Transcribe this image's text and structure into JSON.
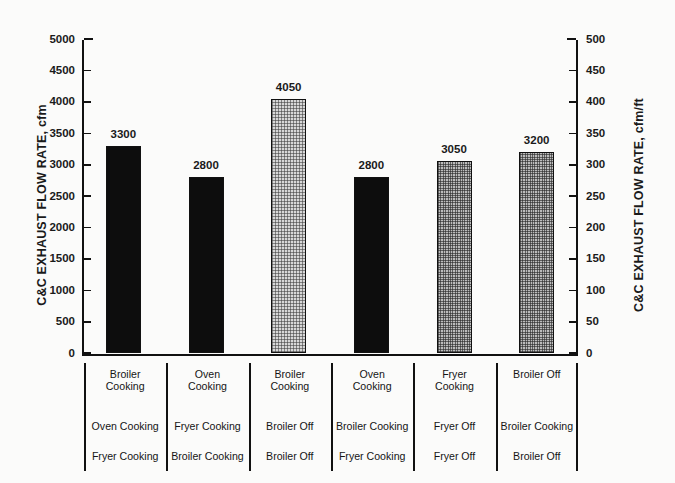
{
  "chart_data": {
    "type": "bar",
    "title": "",
    "categories": [
      "Broiler Cooking / Oven Cooking / Fryer Cooking",
      "Oven Cooking / Fryer Cooking / Broiler Cooking",
      "Broiler Cooking / Broiler Off / Broiler Off",
      "Oven Cooking / Broiler Cooking / Fryer Cooking",
      "Fryer Cooking / Fryer Off / Fryer Off",
      "Broiler Off / Broiler Cooking / Broiler Off"
    ],
    "values": [
      3300,
      2800,
      4050,
      2800,
      3050,
      3200
    ],
    "value_labels": [
      "3300",
      "2800",
      "4050",
      "2800",
      "3050",
      "3200"
    ],
    "bar_patterns": [
      "solid",
      "solid",
      "stipple-light",
      "solid",
      "stipple-dark",
      "stipple-dark"
    ],
    "ylabel": "C&C EXHAUST FLOW RATE, cfm",
    "ylabel_right": "C&C EXHAUST FLOW RATE, cfm/ft",
    "xlabel": "",
    "ylim": [
      0,
      5000
    ],
    "ylim_right": [
      0,
      500
    ],
    "yticks": [
      0,
      500,
      1000,
      1500,
      2000,
      2500,
      3000,
      3500,
      4000,
      4500,
      5000
    ],
    "ytick_labels": [
      "0",
      "500",
      "1000",
      "1500",
      "2000",
      "2500",
      "3000",
      "3500",
      "4000",
      "4500",
      "5000"
    ],
    "yticks_right": [
      0,
      50,
      100,
      150,
      200,
      250,
      300,
      350,
      400,
      450,
      500
    ],
    "ytick_labels_right": [
      "0",
      "50",
      "100",
      "150",
      "200",
      "250",
      "300",
      "350",
      "400",
      "450",
      "500"
    ],
    "grid": false,
    "legend": "none"
  },
  "axes": {
    "left_title": "C&C EXHAUST FLOW RATE, cfm",
    "right_title": "C&C EXHAUST FLOW RATE, cfm/ft"
  },
  "label_table": {
    "columns": [
      {
        "row1": [
          "Broiler",
          "Cooking"
        ],
        "row2": "Oven Cooking",
        "row3": "Fryer Cooking"
      },
      {
        "row1": [
          "Oven",
          "Cooking"
        ],
        "row2": "Fryer Cooking",
        "row3": "Broiler Cooking"
      },
      {
        "row1": [
          "Broiler",
          "Cooking"
        ],
        "row2": "Broiler Off",
        "row3": "Broiler Off"
      },
      {
        "row1": [
          "Oven",
          "Cooking"
        ],
        "row2": "Broiler Cooking",
        "row3": "Fryer Cooking"
      },
      {
        "row1": [
          "Fryer",
          "Cooking"
        ],
        "row2": "Fryer Off",
        "row3": "Fryer Off"
      },
      {
        "row1": [
          "Broiler Off",
          ""
        ],
        "row2": "Broiler Cooking",
        "row3": "Broiler Off"
      }
    ]
  },
  "colors": {
    "ink": "#111111",
    "paper": "#fbfbfa",
    "bar_solid": "#0d0d0d",
    "bar_light": "#d8d8d8",
    "bar_dark": "#bdbdbd"
  }
}
